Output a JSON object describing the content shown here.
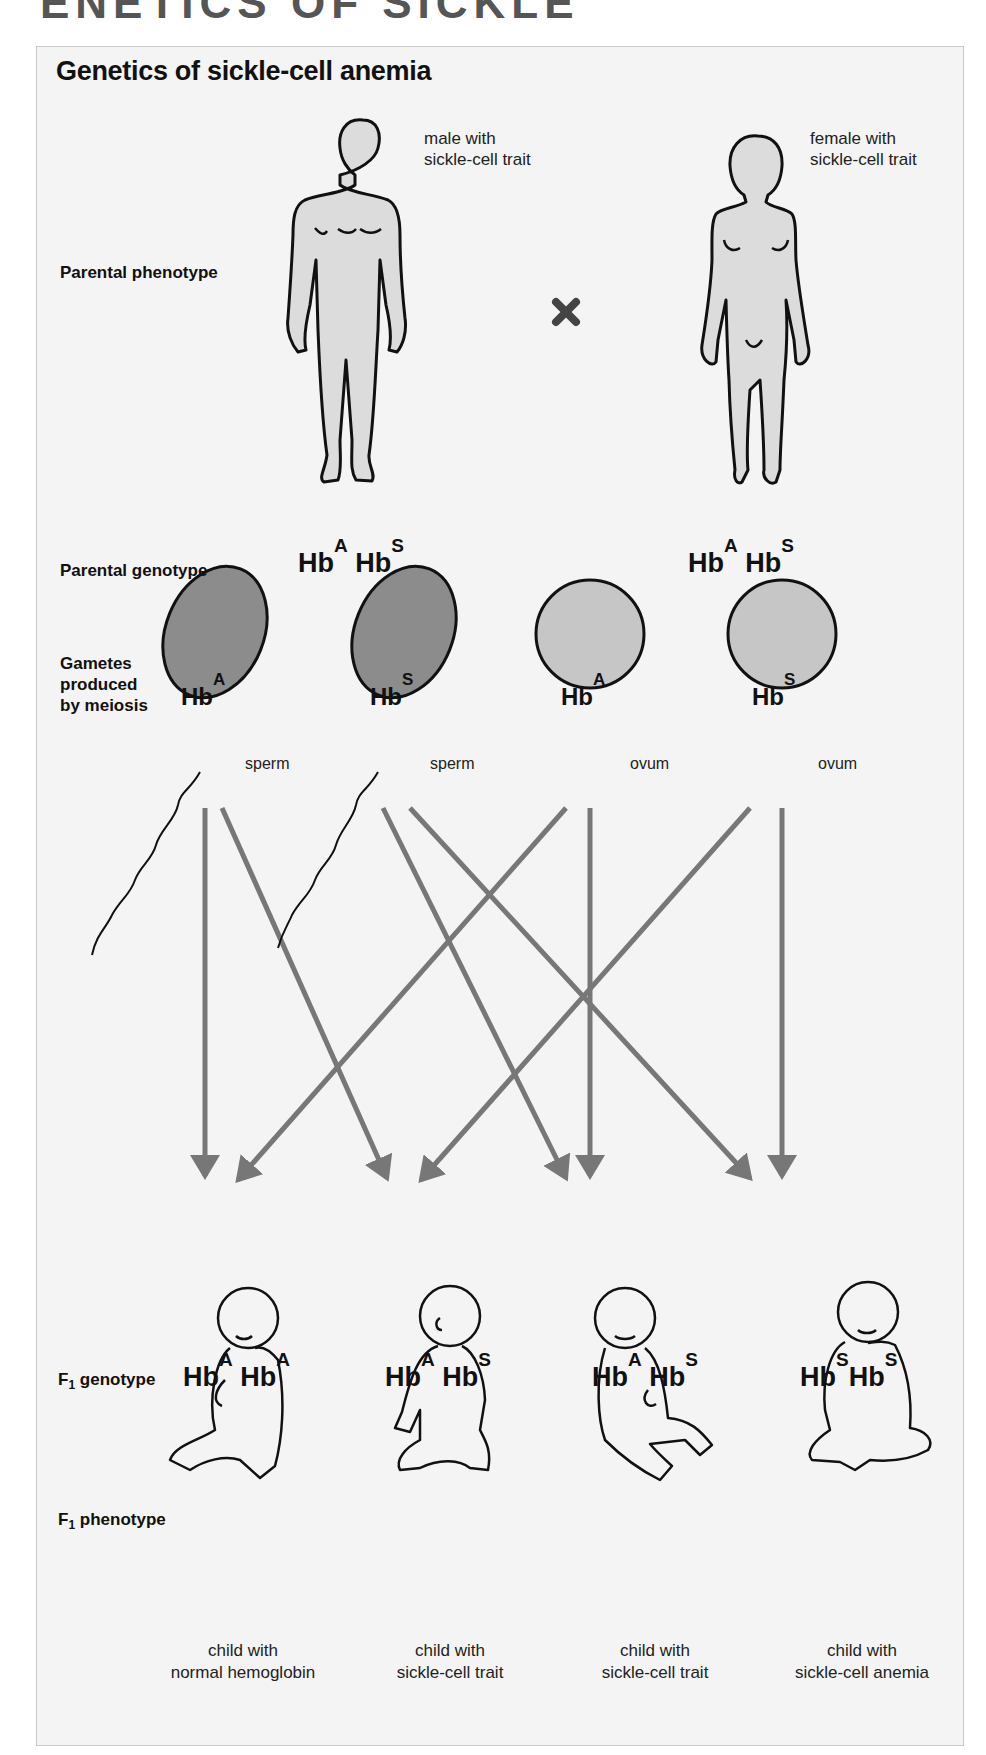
{
  "header_fragment": "ENETICS OF SICKLE",
  "title": "Genetics of sickle-cell anemia",
  "colors": {
    "panel_bg": "#f4f4f4",
    "panel_border": "#c8c8c8",
    "sperm_fill": "#8c8c8c",
    "ovum_fill": "#c6c6c6",
    "body_fill": "#dcdcdc",
    "arrow": "#777777",
    "cross": "#444444"
  },
  "rows": {
    "parental_phenotype": "Parental phenotype",
    "parental_genotype": "Parental genotype",
    "gametes": [
      "Gametes",
      "produced",
      "by meiosis"
    ],
    "f1_genotype": {
      "prefix": "F",
      "sub": "1",
      "suffix": " genotype"
    },
    "f1_phenotype": {
      "prefix": "F",
      "sub": "1",
      "suffix": " phenotype"
    }
  },
  "parents": {
    "male": {
      "note_line1": "male with",
      "note_line2": "sickle-cell trait",
      "genotype": [
        {
          "base": "Hb",
          "allele": "A"
        },
        {
          "base": "Hb",
          "allele": "S"
        }
      ]
    },
    "female": {
      "note_line1": "female with",
      "note_line2": "sickle-cell trait",
      "genotype": [
        {
          "base": "Hb",
          "allele": "A"
        },
        {
          "base": "Hb",
          "allele": "S"
        }
      ]
    },
    "cross_symbol": "✖"
  },
  "gametes": [
    {
      "base": "Hb",
      "allele": "A",
      "type": "sperm"
    },
    {
      "base": "Hb",
      "allele": "S",
      "type": "sperm"
    },
    {
      "base": "Hb",
      "allele": "A",
      "type": "ovum"
    },
    {
      "base": "Hb",
      "allele": "S",
      "type": "ovum"
    }
  ],
  "offspring": [
    {
      "genotype": [
        {
          "base": "Hb",
          "allele": "A"
        },
        {
          "base": "Hb",
          "allele": "A"
        }
      ],
      "caption_line1": "child with",
      "caption_line2": "normal hemoglobin"
    },
    {
      "genotype": [
        {
          "base": "Hb",
          "allele": "A"
        },
        {
          "base": "Hb",
          "allele": "S"
        }
      ],
      "caption_line1": "child with",
      "caption_line2": "sickle-cell trait"
    },
    {
      "genotype": [
        {
          "base": "Hb",
          "allele": "A"
        },
        {
          "base": "Hb",
          "allele": "S"
        }
      ],
      "caption_line1": "child with",
      "caption_line2": "sickle-cell trait"
    },
    {
      "genotype": [
        {
          "base": "Hb",
          "allele": "S"
        },
        {
          "base": "Hb",
          "allele": "S"
        }
      ],
      "caption_line1": "child with",
      "caption_line2": "sickle-cell anemia"
    }
  ],
  "crosses": [
    {
      "from": "sperm Hb A",
      "to": "Hb A Hb A"
    },
    {
      "from": "sperm Hb A",
      "to": "Hb A Hb S"
    },
    {
      "from": "sperm Hb S",
      "to": "Hb A Hb S (2)"
    },
    {
      "from": "sperm Hb S",
      "to": "Hb S Hb S"
    },
    {
      "from": "ovum Hb A",
      "to": "Hb A Hb A"
    },
    {
      "from": "ovum Hb A",
      "to": "Hb A Hb S (2)"
    },
    {
      "from": "ovum Hb S",
      "to": "Hb A Hb S"
    },
    {
      "from": "ovum Hb S",
      "to": "Hb S Hb S"
    }
  ]
}
